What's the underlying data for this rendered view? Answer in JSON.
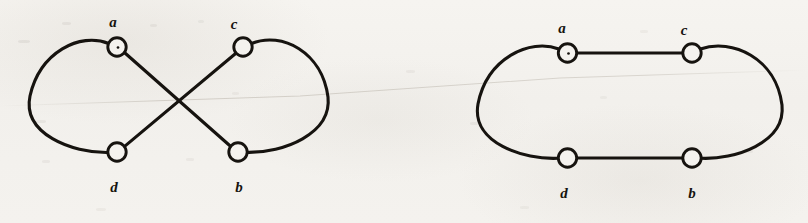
{
  "figure": {
    "title": "",
    "caption": "",
    "background_color": "#f4f2ee",
    "ink_color": "#16130f",
    "panels": [
      {
        "id": "left-panel",
        "name": "crossing-drawing",
        "description": "Graph drawn with two edges crossing",
        "nodes": [
          {
            "id": "a",
            "label": "a",
            "cx": 117,
            "cy": 47,
            "r": 9.5,
            "label_x": 113,
            "label_y": 15,
            "has_center_dot": true
          },
          {
            "id": "c",
            "label": "c",
            "cx": 243,
            "cy": 47,
            "r": 9.5,
            "label_x": 234,
            "label_y": 15,
            "has_center_dot": false
          },
          {
            "id": "d",
            "label": "d",
            "cx": 117,
            "cy": 152,
            "r": 9.5,
            "label_x": 114,
            "label_y": 183,
            "has_center_dot": false
          },
          {
            "id": "b",
            "label": "b",
            "cx": 238,
            "cy": 152,
            "r": 9.5,
            "label_x": 239,
            "label_y": 183,
            "has_center_dot": false
          }
        ],
        "edges": [
          {
            "from": "a",
            "to": "d",
            "style": "curve-left-arc"
          },
          {
            "from": "c",
            "to": "b",
            "style": "curve-right-arc"
          },
          {
            "from": "a",
            "to": "b",
            "style": "straight"
          },
          {
            "from": "c",
            "to": "d",
            "style": "straight"
          }
        ],
        "crossing_point": {
          "x": 178,
          "y": 102
        }
      },
      {
        "id": "right-panel",
        "name": "planar-drawing",
        "description": "Same graph redrawn with no crossings",
        "nodes": [
          {
            "id": "a",
            "label": "a",
            "cx": 567,
            "cy": 53,
            "r": 9.5,
            "label_x": 562,
            "label_y": 21,
            "has_center_dot": true
          },
          {
            "id": "c",
            "label": "c",
            "cx": 692,
            "cy": 53,
            "r": 9.5,
            "label_x": 684,
            "label_y": 21,
            "has_center_dot": false
          },
          {
            "id": "d",
            "label": "d",
            "cx": 567,
            "cy": 158,
            "r": 9.5,
            "label_x": 564,
            "label_y": 189,
            "has_center_dot": false
          },
          {
            "id": "b",
            "label": "b",
            "cx": 692,
            "cy": 158,
            "r": 9.5,
            "label_x": 692,
            "label_y": 189,
            "has_center_dot": false
          }
        ],
        "edges": [
          {
            "from": "a",
            "to": "d",
            "style": "curve-left-arc"
          },
          {
            "from": "c",
            "to": "b",
            "style": "curve-right-arc"
          },
          {
            "from": "a",
            "to": "c",
            "style": "straight"
          },
          {
            "from": "d",
            "to": "b",
            "style": "straight"
          }
        ],
        "crossing_point": null
      }
    ]
  },
  "labels": {
    "left": {
      "a": "a",
      "c": "c",
      "d": "d",
      "b": "b"
    },
    "right": {
      "a": "a",
      "c": "c",
      "d": "d",
      "b": "b"
    }
  }
}
